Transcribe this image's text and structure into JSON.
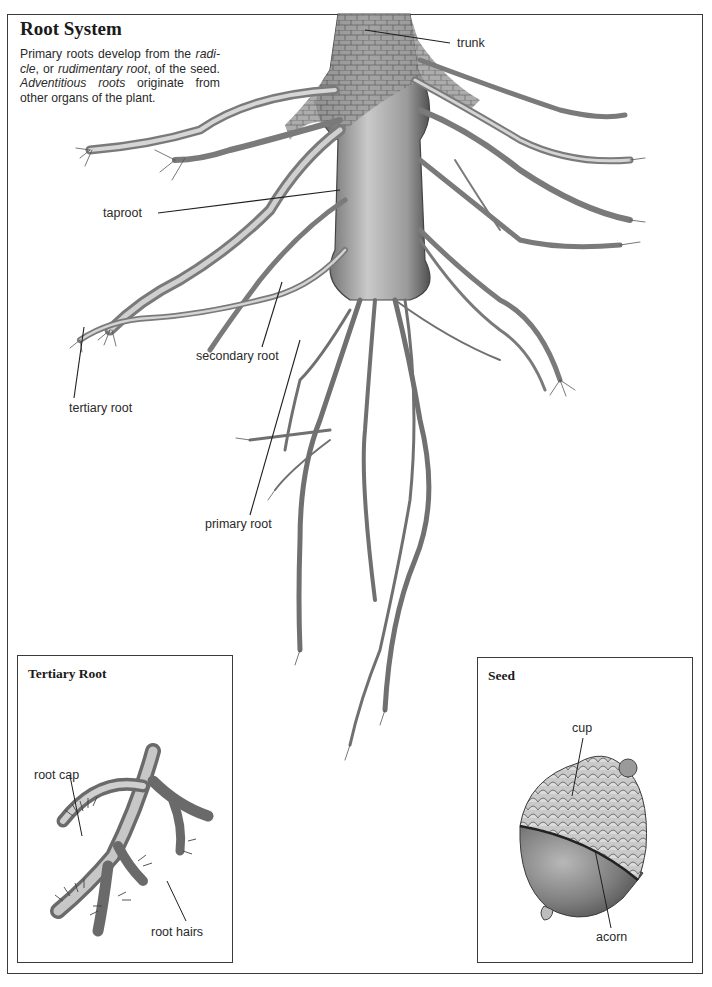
{
  "main": {
    "title": "Root System",
    "intro": {
      "part1": "Primary roots develop from the ",
      "radicle": "radi-cle",
      "part2": ", or ",
      "rudimentary": "rudimentary root",
      "part3": ", of the seed. ",
      "adventitious": "Adventitious roots",
      "part4": " originate from other organs of the plant."
    },
    "labels": {
      "trunk": "trunk",
      "taproot": "taproot",
      "secondary_root": "secondary root",
      "tertiary_root": "tertiary root",
      "primary_root": "primary root"
    }
  },
  "insets": {
    "tertiary": {
      "title": "Tertiary Root",
      "labels": {
        "root_cap": "root cap",
        "root_hairs": "root hairs"
      }
    },
    "seed": {
      "title": "Seed",
      "labels": {
        "cup": "cup",
        "acorn": "acorn"
      }
    }
  },
  "colors": {
    "ink": "#2a2a2a",
    "root_shade": "#8a8a8a",
    "root_light": "#c8c8c8",
    "frame": "#3a3a3a"
  }
}
